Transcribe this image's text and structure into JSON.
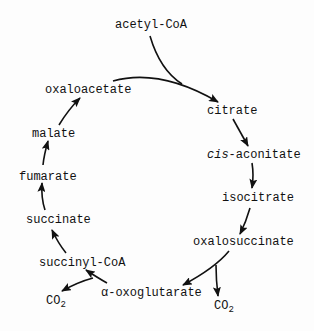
{
  "diagram": {
    "nodes": {
      "acetyl_coa": "acetyl-CoA",
      "oxaloacetate": "oxaloacetate",
      "citrate": "citrate",
      "cis_prefix": "cis",
      "cis_aconitate_rest": "-aconitate",
      "isocitrate": "isocitrate",
      "oxalosuccinate": "oxalosuccinate",
      "alpha_oxoglutarate": "α-oxoglutarate",
      "succinyl_coa": "succinyl-CoA",
      "succinate": "succinate",
      "fumarate": "fumarate",
      "malate": "malate",
      "co2_main": "CO",
      "co2_sub": "2"
    },
    "edges": [
      [
        "acetyl-CoA",
        "citrate"
      ],
      [
        "oxaloacetate",
        "citrate"
      ],
      [
        "citrate",
        "cis-aconitate"
      ],
      [
        "cis-aconitate",
        "isocitrate"
      ],
      [
        "isocitrate",
        "oxalosuccinate"
      ],
      [
        "oxalosuccinate",
        "α-oxoglutarate"
      ],
      [
        "oxalosuccinate",
        "CO2"
      ],
      [
        "α-oxoglutarate",
        "succinyl-CoA"
      ],
      [
        "α-oxoglutarate",
        "CO2"
      ],
      [
        "succinyl-CoA",
        "succinate"
      ],
      [
        "succinate",
        "fumarate"
      ],
      [
        "fumarate",
        "malate"
      ],
      [
        "malate",
        "oxaloacetate"
      ]
    ]
  }
}
